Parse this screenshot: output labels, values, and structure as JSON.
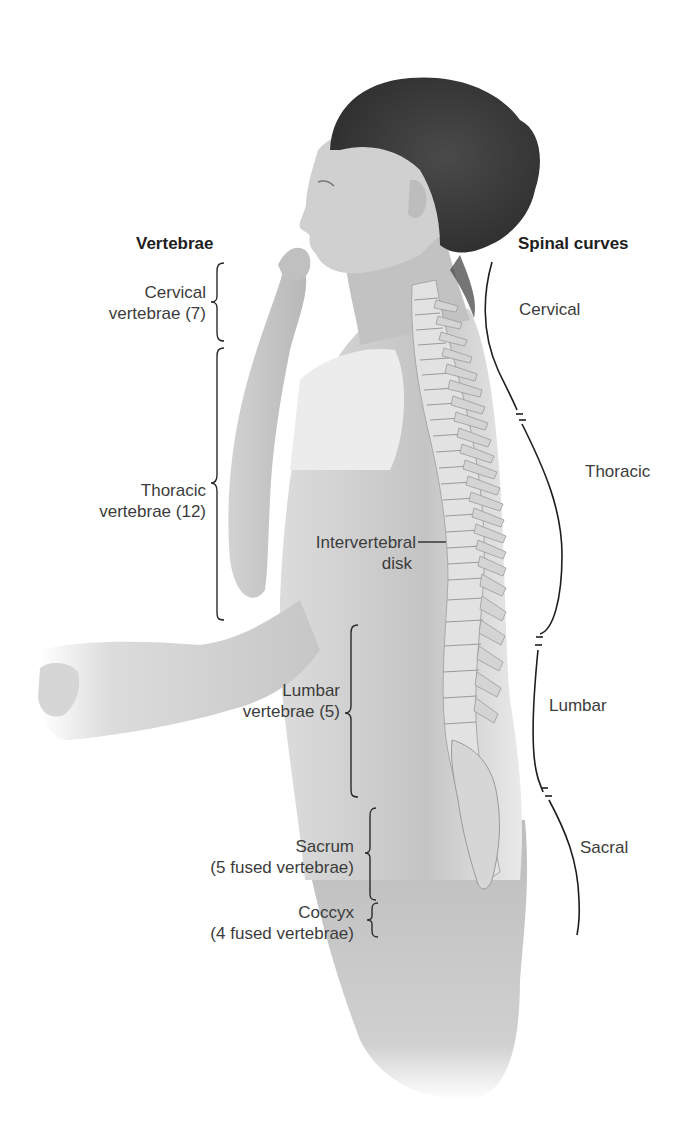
{
  "headings": {
    "vertebrae": "Vertebrae",
    "spinal_curves": "Spinal curves"
  },
  "vertebrae_labels": [
    {
      "id": "cervical",
      "line1": "Cervical",
      "line2": "vertebrae (7)"
    },
    {
      "id": "thoracic",
      "line1": "Thoracic",
      "line2": "vertebrae (12)"
    },
    {
      "id": "lumbar",
      "line1": "Lumbar",
      "line2": "vertebrae (5)"
    },
    {
      "id": "sacrum",
      "line1": "Sacrum",
      "line2": "(5 fused vertebrae)"
    },
    {
      "id": "coccyx",
      "line1": "Coccyx",
      "line2": "(4 fused vertebrae)"
    }
  ],
  "intervertebral": {
    "line1": "Intervertebral",
    "line2": "disk"
  },
  "curve_labels": [
    {
      "id": "cervical",
      "label": "Cervical"
    },
    {
      "id": "thoracic",
      "label": "Thoracic"
    },
    {
      "id": "lumbar",
      "label": "Lumbar"
    },
    {
      "id": "sacral",
      "label": "Sacral"
    }
  ],
  "colors": {
    "background": "#ffffff",
    "text": "#3c3c3c",
    "heading": "#1e1e1e",
    "hair": "#3f3f3f",
    "skin": "#c9c9c9",
    "shirt": "#e6e6e6",
    "bone": "#d8d8d8"
  }
}
